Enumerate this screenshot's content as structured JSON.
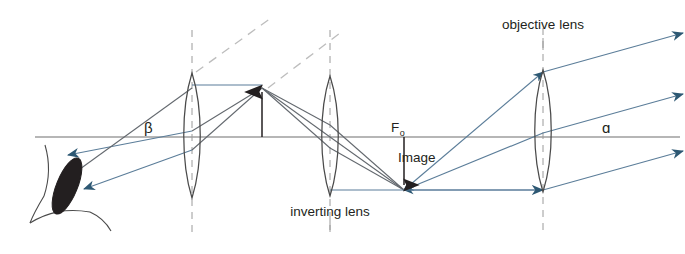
{
  "figure": {
    "type": "optical-ray-diagram",
    "width": 685,
    "height": 254
  },
  "colors": {
    "background": "#ffffff",
    "axis": "#6e6e6e",
    "ray_gray": "#63686e",
    "ray_blue": "#5b7d99",
    "arrowhead_blue": "#2d5873",
    "dashed_gray": "#b9b9b9",
    "lens_outline": "#4a4a4a",
    "pupil": "#231f20",
    "text": "#231f20"
  },
  "labels": {
    "objective_lens": "objective lens",
    "inverting_lens": "inverting lens",
    "focal_point": "F",
    "focal_point_subscript": "o",
    "image": "Image",
    "angle_beta": "β",
    "angle_alpha": "ɑ"
  },
  "components": {
    "eye": {
      "name": "eye",
      "center_x": 62,
      "center_y": 182
    },
    "lenses": [
      {
        "name": "eyepiece-lens",
        "x": 192,
        "top_y": 73,
        "bottom_y": 198,
        "half_width": 9
      },
      {
        "name": "inverting-lens",
        "x": 330,
        "top_y": 76,
        "bottom_y": 196,
        "half_width": 9
      },
      {
        "name": "objective-lens",
        "x": 543,
        "top_y": 70,
        "bottom_y": 192,
        "half_width": 9
      }
    ],
    "optical_axis": {
      "y": 137,
      "x_start": 35,
      "x_end": 680
    },
    "object_arrow": {
      "name": "intermediate-image-arrow",
      "x": 262,
      "base_y": 137,
      "tip_y": 86,
      "direction": "up"
    },
    "image_arrow": {
      "name": "primary-image-arrow",
      "x": 404,
      "base_y": 137,
      "tip_y": 190,
      "direction": "down"
    }
  },
  "annotations": {
    "objective_lens_label_pos": {
      "x": 543,
      "y": 32
    },
    "inverting_lens_label_pos": {
      "x": 330,
      "y": 215
    },
    "focal_point_label_pos": {
      "x": 396,
      "y": 130
    },
    "image_label_pos": {
      "x": 400,
      "y": 160
    },
    "beta_label_pos": {
      "x": 148,
      "y": 132
    },
    "alpha_label_pos": {
      "x": 606,
      "y": 137
    }
  }
}
